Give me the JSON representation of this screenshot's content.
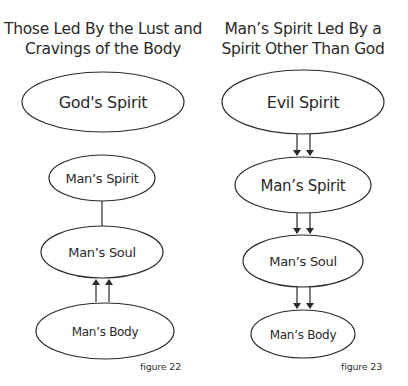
{
  "colors": {
    "stroke": "#2a2a2a",
    "text": "#2a2a2a",
    "background": "#ffffff"
  },
  "figures": [
    {
      "title_lines": [
        "Those Led By the Lust and",
        "Cravings of the Body"
      ],
      "caption": "figure 22",
      "nodes": [
        {
          "id": "gods-spirit",
          "label": "God's Spirit"
        },
        {
          "id": "mans-spirit",
          "label": "Man’s Spirit"
        },
        {
          "id": "mans-soul",
          "label": "Man’s Soul"
        },
        {
          "id": "mans-body",
          "label": "Man’s Body"
        }
      ],
      "edges": [
        {
          "from": "mans-spirit",
          "to": "mans-soul",
          "type": "line"
        },
        {
          "from": "mans-body",
          "to": "mans-soul",
          "type": "double-arrow"
        }
      ]
    },
    {
      "title_lines": [
        "Man’s Spirit Led By a",
        "Spirit Other Than God"
      ],
      "caption": "figure 23",
      "nodes": [
        {
          "id": "evil-spirit",
          "label": "Evil Spirit"
        },
        {
          "id": "mans-spirit",
          "label": "Man’s Spirit"
        },
        {
          "id": "mans-soul",
          "label": "Man’s Soul"
        },
        {
          "id": "mans-body",
          "label": "Man’s Body"
        }
      ],
      "edges": [
        {
          "from": "evil-spirit",
          "to": "mans-spirit",
          "type": "double-arrow"
        },
        {
          "from": "mans-spirit",
          "to": "mans-soul",
          "type": "double-arrow"
        },
        {
          "from": "mans-soul",
          "to": "mans-body",
          "type": "double-arrow"
        }
      ]
    }
  ]
}
